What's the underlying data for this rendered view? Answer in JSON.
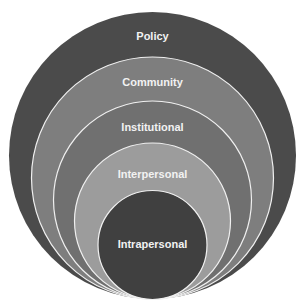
{
  "diagram": {
    "type": "nested-circles",
    "levels": [
      {
        "label": "Policy",
        "color": "#4b4b4b"
      },
      {
        "label": "Community",
        "color": "#7e7e7e"
      },
      {
        "label": "Institutional",
        "color": "#707070"
      },
      {
        "label": "Interpersonal",
        "color": "#9c9c9c"
      },
      {
        "label": "Intrapersonal",
        "color": "#404040"
      }
    ],
    "stroke_color": "#f0f0f0"
  }
}
